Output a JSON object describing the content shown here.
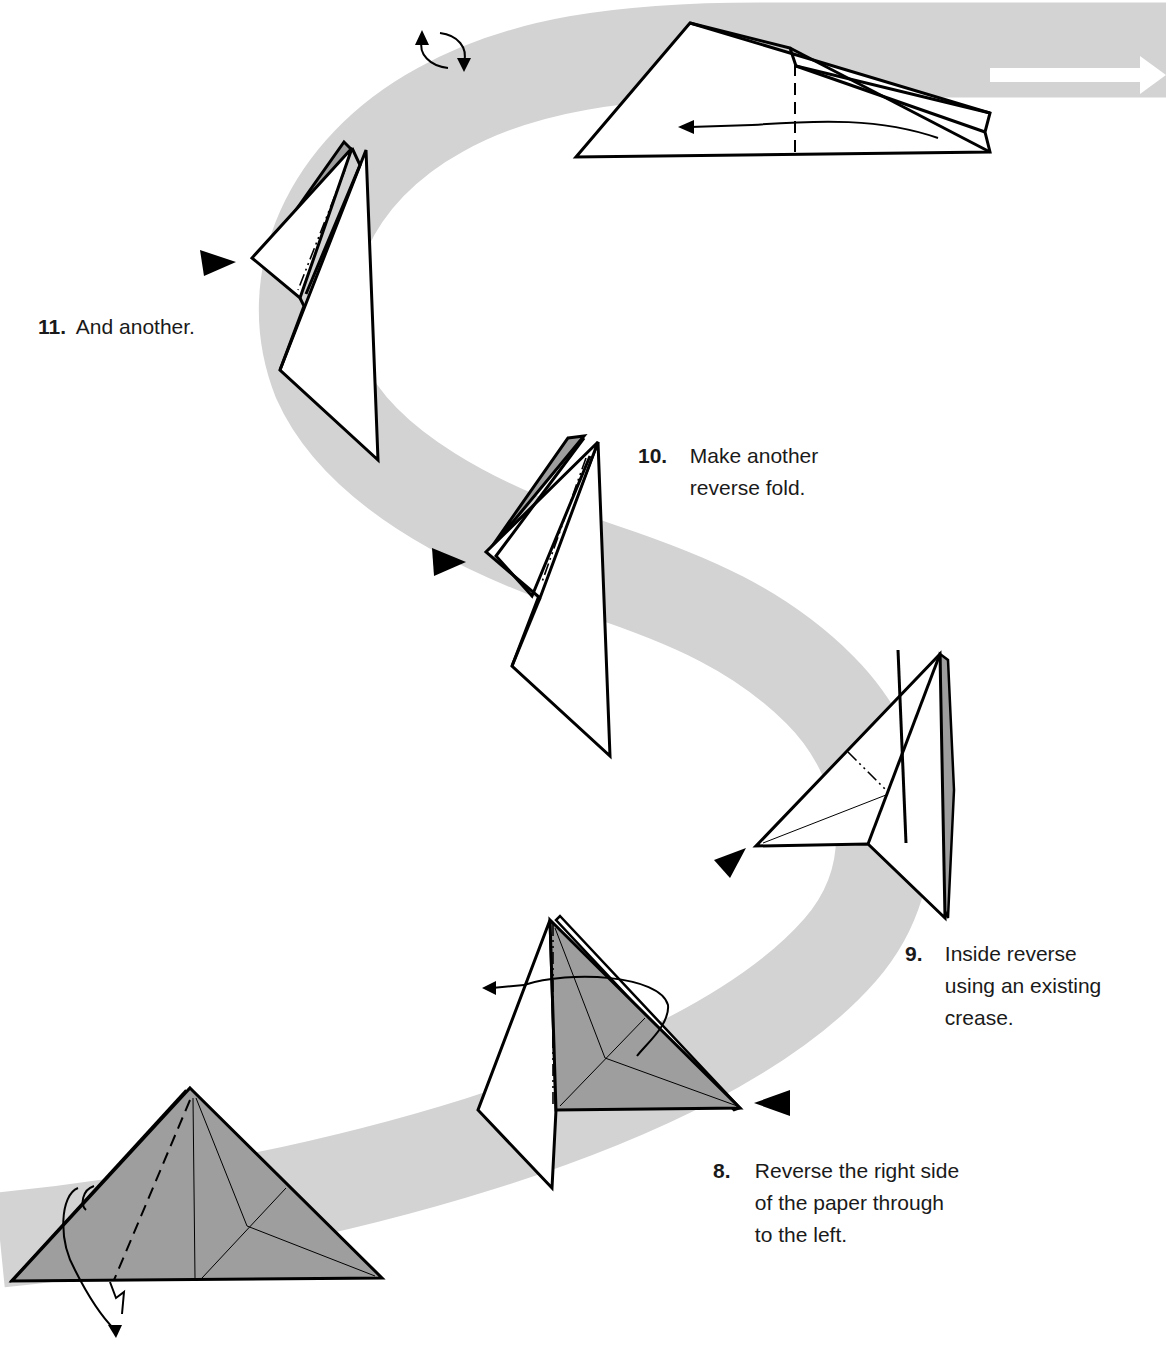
{
  "colors": {
    "background": "#ffffff",
    "band": "#d3d3d3",
    "paper_white": "#ffffff",
    "paper_colored": "#9e9e9e",
    "line": "#000000"
  },
  "icons": {
    "turn_over": "turn-over-icon",
    "push_arrow": "push-arrow-icon",
    "flow_arrow": "flow-arrow-icon"
  },
  "steps": [
    {
      "number": "8.",
      "text": "Reverse the right side\nof the paper through\nto the left."
    },
    {
      "number": "9.",
      "text": "Inside reverse\nusing an existing\ncrease."
    },
    {
      "number": "10.",
      "text": "Make another\nreverse fold."
    },
    {
      "number": "11.",
      "text": "And another."
    }
  ]
}
